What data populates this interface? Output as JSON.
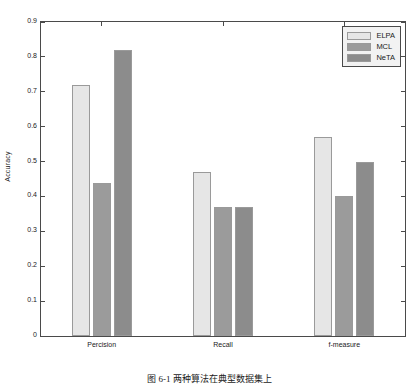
{
  "chart_data": {
    "type": "bar",
    "title": "",
    "xlabel": "",
    "ylabel": "Accuracy",
    "categories": [
      "Percision",
      "Recall",
      "f-measure"
    ],
    "series": [
      {
        "name": "ELPA",
        "values": [
          0.72,
          0.47,
          0.57
        ],
        "color": "#e6e6e6"
      },
      {
        "name": "MCL",
        "values": [
          0.44,
          0.37,
          0.4
        ],
        "color": "#9b9b9b"
      },
      {
        "name": "NeTA",
        "values": [
          0.82,
          0.37,
          0.5
        ],
        "color": "#8c8c8c"
      }
    ],
    "ylim": [
      0,
      0.9
    ],
    "yticks": [
      "0",
      "0.1",
      "0.2",
      "0.3",
      "0.4",
      "0.5",
      "0.6",
      "0.7",
      "0.8",
      "0.9"
    ],
    "ytick_values": [
      0,
      0.1,
      0.2,
      0.3,
      0.4,
      0.5,
      0.6,
      0.7,
      0.8,
      0.9
    ],
    "grid": false,
    "legend_position": "top-right",
    "bar_edge_color": "#9a9a9a",
    "axis_color": "#4a4a4a"
  },
  "legend": {
    "items": [
      {
        "label": "ELPA"
      },
      {
        "label": "MCL"
      },
      {
        "label": "NeTA"
      }
    ]
  },
  "caption": {
    "text": "图 6-1  两种算法在典型数据集上"
  }
}
